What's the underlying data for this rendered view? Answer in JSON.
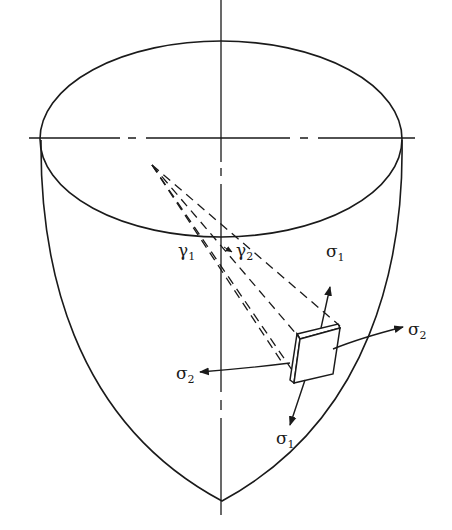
{
  "figure": {
    "title": "",
    "colors": {
      "line": "#1a1a1a",
      "background": "#ffffff"
    }
  },
  "labels": {
    "gamma1": {
      "base": "γ",
      "sub": "1"
    },
    "gamma2": {
      "base": "γ",
      "sub": "2"
    },
    "sigma1_top": {
      "base": "σ",
      "sub": "1"
    },
    "sigma1_bottom": {
      "base": "σ",
      "sub": "1"
    },
    "sigma2_right": {
      "base": "σ",
      "sub": "2"
    },
    "sigma2_left": {
      "base": "σ",
      "sub": "2"
    }
  }
}
